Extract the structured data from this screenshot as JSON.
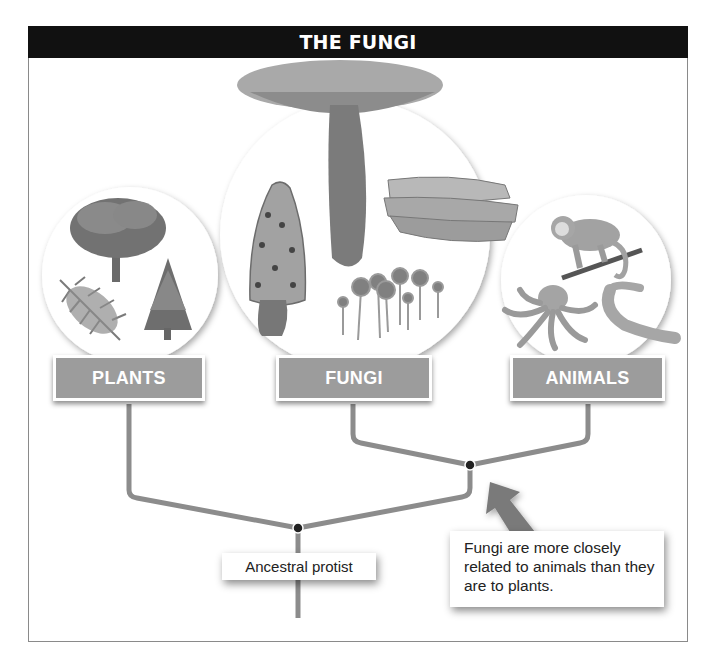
{
  "header": {
    "title": "THE FUNGI"
  },
  "groups": [
    {
      "label": "PLANTS",
      "illustrations": [
        "tree-icon",
        "fern-icon",
        "conifer-icon"
      ]
    },
    {
      "label": "FUNGI",
      "illustrations": [
        "mushroom-icon",
        "morel-icon",
        "shelf-fungus-icon",
        "mold-icon"
      ]
    },
    {
      "label": "ANIMALS",
      "illustrations": [
        "monkey-icon",
        "octopus-icon",
        "worm-icon"
      ]
    }
  ],
  "tree": {
    "root_label": "Ancestral protist",
    "callout": "Fungi are more closely related to animals than they are to plants."
  },
  "colors": {
    "header_bg": "#111111",
    "label_fill": "#9c9c9c",
    "branch": "#8c8c8c",
    "node": "#222222"
  }
}
